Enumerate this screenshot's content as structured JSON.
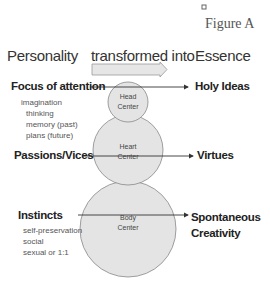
{
  "figure_label": "Figure A",
  "headers": {
    "left": "Personality",
    "middle": "transformed into",
    "right": "Essence"
  },
  "rows": [
    {
      "left_title": "Focus of attention",
      "left_items": [
        "imagination",
        "thinking",
        "memory (past)",
        "plans (future)"
      ],
      "center_line1": "Head",
      "center_line2": "Center",
      "right_title": "Holy Ideas",
      "right_title_line2": ""
    },
    {
      "left_title": "Passions/Vices",
      "left_items": [],
      "center_line1": "Heart",
      "center_line2": "Center",
      "right_title": "Virtues",
      "right_title_line2": ""
    },
    {
      "left_title": "Instincts",
      "left_items": [
        "self-preservation",
        "social",
        "sexual or 1:1"
      ],
      "center_line1": "Body",
      "center_line2": "Center",
      "right_title": "Spontaneous",
      "right_title_line2": "Creativity"
    }
  ],
  "colors": {
    "circle_fill": "#e4e4e4",
    "circle_stroke": "#888888",
    "arrow": "#333333"
  }
}
